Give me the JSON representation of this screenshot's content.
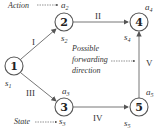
{
  "diagram": {
    "nodes": [
      {
        "id": "1",
        "label": "1",
        "state": "s",
        "state_sub": "1"
      },
      {
        "id": "2",
        "label": "2",
        "state": "s",
        "state_sub": "2",
        "action": "a",
        "action_sub": "2"
      },
      {
        "id": "3",
        "label": "3",
        "state": "s",
        "state_sub": "3",
        "action": "a",
        "action_sub": "3"
      },
      {
        "id": "4",
        "label": "4",
        "state": "s",
        "state_sub": "4",
        "action": "a",
        "action_sub": "4"
      },
      {
        "id": "5",
        "label": "5",
        "state": "s",
        "state_sub": "5",
        "action": "a",
        "action_sub": "5"
      }
    ],
    "edges": [
      {
        "from": "1",
        "to": "2",
        "label": "I"
      },
      {
        "from": "2",
        "to": "4",
        "label": "II"
      },
      {
        "from": "1",
        "to": "3",
        "label": "III"
      },
      {
        "from": "3",
        "to": "5",
        "label": "IV"
      },
      {
        "from": "5",
        "to": "4",
        "label": "V"
      }
    ],
    "annotations": {
      "action": "Action",
      "state": "State",
      "direction_line1": "Possible",
      "direction_line2": "forwarding",
      "direction_line3": "direction"
    },
    "colors": {
      "stroke": "#555555",
      "text": "#333333"
    }
  }
}
